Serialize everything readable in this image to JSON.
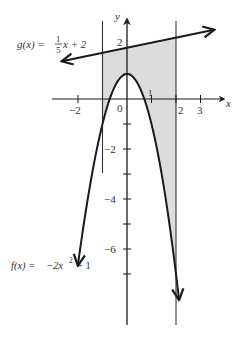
{
  "chart_data": {
    "type": "line",
    "title": "",
    "xlabel": "x",
    "ylabel": "y",
    "grid": false,
    "origin_px": [
      127,
      99
    ],
    "scale_px": {
      "x": 24.5,
      "y": 25
    },
    "xlim": [
      -2.3,
      4.0
    ],
    "ylim": [
      -9.0,
      3.3
    ],
    "x_ticks": [
      -2,
      -1,
      1,
      2,
      3
    ],
    "x_tick_labels": [
      {
        "value": -2,
        "label": "−2"
      },
      {
        "value": 0,
        "label": "0"
      },
      {
        "value": 1,
        "label": "1"
      },
      {
        "value": 2,
        "label": "2"
      },
      {
        "value": 3,
        "label": "3"
      }
    ],
    "y_ticks": [
      2,
      1,
      -1,
      -2,
      -3,
      -4,
      -5,
      -6,
      -7
    ],
    "y_tick_labels": [
      {
        "value": 2,
        "label": "2"
      },
      {
        "value": -2,
        "label": "−2"
      },
      {
        "value": -4,
        "label": "−4"
      },
      {
        "value": -6,
        "label": "−6"
      }
    ],
    "series": [
      {
        "name": "g(x) = (1/5)x + 2",
        "kind": "line",
        "slope": 0.2,
        "intercept": 2,
        "x_range": [
          -2.6,
          3.5
        ],
        "arrows": "both"
      },
      {
        "name": "f(x) = −2x² + 1",
        "kind": "parabola",
        "a": -2,
        "b": 0,
        "c": 1,
        "x_range": [
          -2.0,
          2.12
        ],
        "arrows": "both"
      }
    ],
    "shaded_region": {
      "between": [
        "g(x)",
        "f(x)"
      ],
      "x_from": -1,
      "x_to": 2,
      "color": "#dcdcdc"
    },
    "vertical_lines": [
      -1,
      2
    ],
    "annotations": [
      {
        "text_parts": [
          "g(x) = ",
          "1",
          "5",
          "x + 2"
        ],
        "near": "g"
      },
      {
        "text_parts": [
          "f(x) = −2x",
          "2",
          " + 1"
        ],
        "near": "f"
      }
    ]
  },
  "labels": {
    "x_axis": "x",
    "y_axis": "y",
    "g_label_prefix": "g(x) =",
    "g_frac_num": "1",
    "g_frac_den": "5",
    "g_label_suffix": "x + 2",
    "f_label_prefix": "f(x) =",
    "f_label_coef": "−2x",
    "f_label_exp": "2",
    "f_label_suffix": "+ 1",
    "tick_neg2": "−2",
    "tick_0": "0",
    "tick_1": "1",
    "tick_2": "2",
    "tick_3": "3",
    "ytick_2": "2",
    "ytick_neg2": "−2",
    "ytick_neg4": "−4",
    "ytick_neg6": "−6"
  },
  "colors": {
    "ink": "#1a1a1a",
    "shade": "#dcdcdc",
    "text": "#333333"
  }
}
